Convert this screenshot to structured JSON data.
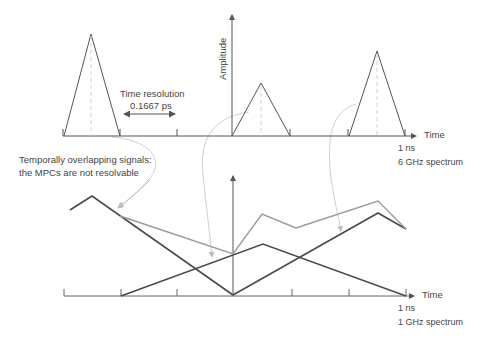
{
  "upper_panel": {
    "y_axis_label": "Amplitude",
    "x_axis_label": "Time",
    "time_resolution_label": "Time resolution",
    "time_resolution_value": "0.1667 ps",
    "duration_label": "1 ns",
    "spectrum_label": "6 GHz spectrum",
    "pulses": [
      {
        "base_start": 64,
        "base_end": 120,
        "peak_x": 91,
        "peak_y": 34
      },
      {
        "base_start": 232,
        "base_end": 290,
        "peak_x": 261,
        "peak_y": 83
      },
      {
        "base_start": 348,
        "base_end": 405,
        "peak_x": 377,
        "peak_y": 51
      }
    ]
  },
  "annotation": {
    "line1": "Temporally overlapping signals:",
    "line2": "the MPCs are not resolvable"
  },
  "lower_panel": {
    "x_axis_label": "Time",
    "duration_label": "1 ns",
    "spectrum_label": "1 GHz spectrum"
  },
  "colors": {
    "dark_line": "#4a4a4a",
    "sum_line": "#9a9a9a",
    "arrow_curve": "#c8c8c8",
    "dashed": "#cccccc",
    "axis": "#555555"
  }
}
